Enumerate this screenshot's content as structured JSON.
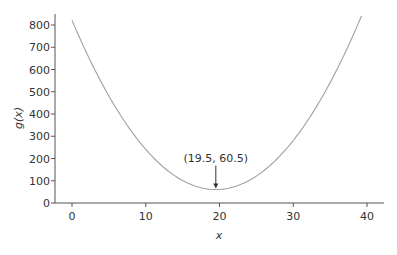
{
  "chart_data": {
    "type": "line",
    "title": "",
    "xlabel": "x",
    "ylabel": "g(x)",
    "xlim": [
      -2.3,
      42.3
    ],
    "ylim": [
      0,
      850
    ],
    "xticks": [
      0,
      10,
      20,
      30,
      40
    ],
    "yticks": [
      0,
      100,
      200,
      300,
      400,
      500,
      600,
      700,
      800
    ],
    "grid": false,
    "legend": null,
    "series": [
      {
        "name": "g(x)",
        "function": "2*(x-19.5)^2 + 60.5",
        "x": [
          0,
          5,
          10,
          15,
          19.5,
          25,
          30,
          35,
          39
        ],
        "y": [
          821,
          481,
          241,
          101,
          60.5,
          121,
          281,
          541,
          821
        ],
        "color": "#999999"
      }
    ],
    "annotations": [
      {
        "text": "(19.5, 60.5)",
        "x": 19.5,
        "y": 60.5,
        "arrow": true
      }
    ]
  },
  "labels": {
    "xlabel": "x",
    "ylabel": "g(x)",
    "annotation": "(19.5, 60.5)",
    "xticks": [
      "0",
      "10",
      "20",
      "30",
      "40"
    ],
    "yticks": [
      "0",
      "100",
      "200",
      "300",
      "400",
      "500",
      "600",
      "700",
      "800"
    ]
  }
}
